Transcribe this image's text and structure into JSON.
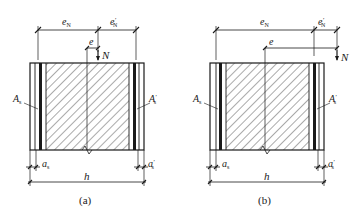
{
  "figure": {
    "panels": [
      {
        "id": "a",
        "caption": "(a)",
        "labels": {
          "eN": "e",
          "eN_sub": "N",
          "eNp": "e",
          "eNp_sub": "N",
          "eNp_prime": "′",
          "e": "e",
          "N": "N",
          "As": "A",
          "As_sub": "s",
          "Asp": "A",
          "Asp_sub": "s",
          "Asp_prime": "′",
          "as": "a",
          "as_sub": "s",
          "asp": "a",
          "asp_sub": "s",
          "asp_prime": "′",
          "h": "h"
        },
        "description": "Small eccentric tension: axial force N acts between As and A's"
      },
      {
        "id": "b",
        "caption": "(b)",
        "labels": {
          "eN": "e",
          "eN_sub": "N",
          "eNp": "e",
          "eNp_sub": "N",
          "eNp_prime": "′",
          "e": "e",
          "N": "N",
          "As": "A",
          "As_sub": "s",
          "Asp": "A",
          "Asp_sub": "s",
          "Asp_prime": "′",
          "as": "a",
          "as_sub": "s",
          "asp": "a",
          "asp_sub": "s",
          "asp_prime": "′",
          "h": "h"
        },
        "description": "Large eccentric tension: axial force N acts outside A's"
      }
    ],
    "colors": {
      "line": "#1a1a1a",
      "background": "#ffffff"
    }
  }
}
